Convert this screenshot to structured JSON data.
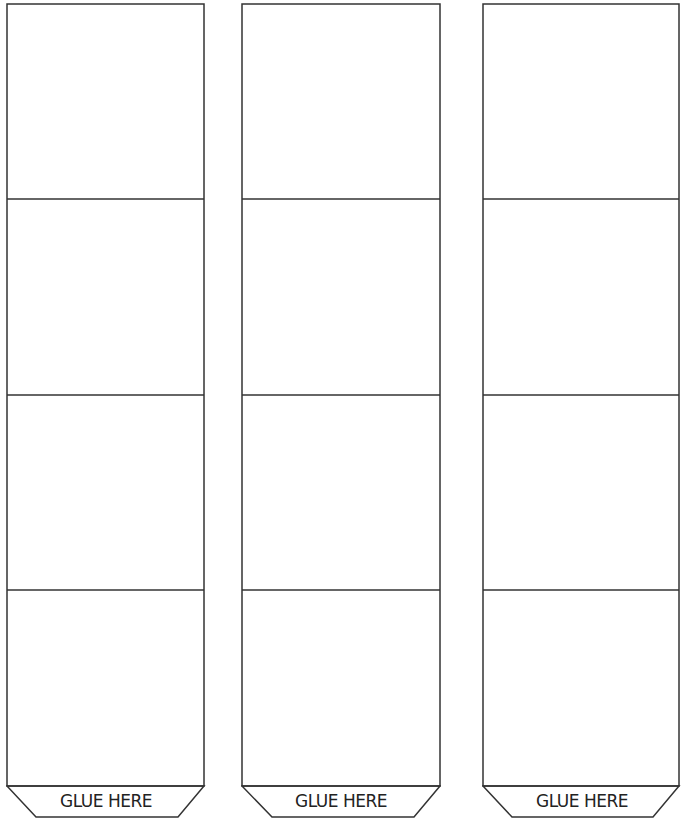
{
  "page": {
    "background": "#ffffff",
    "line_color": "#333333"
  },
  "strips": [
    {
      "left": 7,
      "right": 204,
      "cells": [
        {
          "label": ""
        },
        {
          "label": ""
        },
        {
          "label": ""
        },
        {
          "label": ""
        }
      ],
      "glue_tab": {
        "label": "GLUE HERE"
      }
    },
    {
      "left": 242,
      "right": 440,
      "cells": [
        {
          "label": ""
        },
        {
          "label": ""
        },
        {
          "label": ""
        },
        {
          "label": ""
        }
      ],
      "glue_tab": {
        "label": "GLUE HERE"
      }
    },
    {
      "left": 483,
      "right": 679,
      "cells": [
        {
          "label": ""
        },
        {
          "label": ""
        },
        {
          "label": ""
        },
        {
          "label": ""
        }
      ],
      "glue_tab": {
        "label": "GLUE HERE"
      }
    }
  ]
}
